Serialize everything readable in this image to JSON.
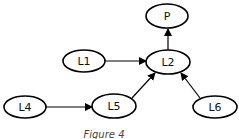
{
  "diagram": {
    "caption": "Figure 4",
    "nodes": [
      {
        "id": "P",
        "label": "P",
        "cx": 167,
        "cy": 16,
        "rx": 21,
        "ry": 12
      },
      {
        "id": "L1",
        "label": "L1",
        "cx": 84,
        "cy": 61,
        "rx": 21,
        "ry": 11
      },
      {
        "id": "L2",
        "label": "L2",
        "cx": 168,
        "cy": 62,
        "rx": 22,
        "ry": 12
      },
      {
        "id": "L4",
        "label": "L4",
        "cx": 25,
        "cy": 107,
        "rx": 21,
        "ry": 11
      },
      {
        "id": "L5",
        "label": "L5",
        "cx": 114,
        "cy": 106,
        "rx": 22,
        "ry": 12
      },
      {
        "id": "L6",
        "label": "L6",
        "cx": 215,
        "cy": 107,
        "rx": 22,
        "ry": 11
      }
    ],
    "edges": [
      {
        "from": "L2",
        "to": "P"
      },
      {
        "from": "L1",
        "to": "L2"
      },
      {
        "from": "L4",
        "to": "L5"
      },
      {
        "from": "L5",
        "to": "L2"
      },
      {
        "from": "L6",
        "to": "L2"
      }
    ],
    "colors": {
      "stroke": "#000000",
      "fill": "#ffffff",
      "caption": "#444444"
    }
  }
}
